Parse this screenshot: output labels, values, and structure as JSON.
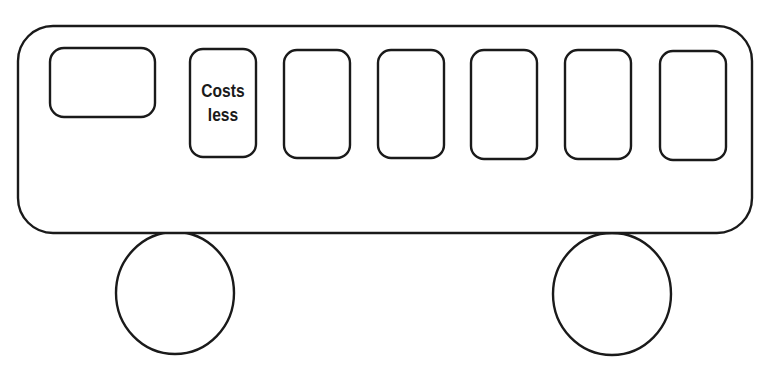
{
  "diagram": {
    "colors": {
      "stroke": "#1a1a1a",
      "fill": "#ffffff",
      "background": "#ffffff"
    },
    "body": {
      "x": 18,
      "y": 26,
      "width": 734,
      "height": 207,
      "radius": 35
    },
    "driver_window": {
      "x": 50,
      "y": 48,
      "width": 105,
      "height": 69,
      "radius": 14
    },
    "windows": [
      {
        "x": 190,
        "y": 49,
        "width": 66,
        "height": 108,
        "radius": 13,
        "label": "Costs\nless"
      },
      {
        "x": 284,
        "y": 50,
        "width": 66,
        "height": 108,
        "radius": 13,
        "label": ""
      },
      {
        "x": 378,
        "y": 50,
        "width": 66,
        "height": 108,
        "radius": 13,
        "label": ""
      },
      {
        "x": 471,
        "y": 50,
        "width": 66,
        "height": 109,
        "radius": 13,
        "label": ""
      },
      {
        "x": 565,
        "y": 50,
        "width": 66,
        "height": 109,
        "radius": 13,
        "label": ""
      },
      {
        "x": 660,
        "y": 51,
        "width": 66,
        "height": 109,
        "radius": 13,
        "label": ""
      }
    ],
    "wheels": [
      {
        "cx": 175,
        "cy": 293,
        "rx": 59,
        "ry": 61
      },
      {
        "cx": 612,
        "cy": 294,
        "rx": 59,
        "ry": 61
      }
    ]
  },
  "labels": {
    "window_1": "Costs\nless"
  }
}
